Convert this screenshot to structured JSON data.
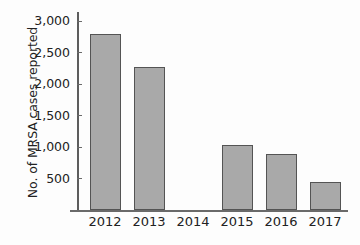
{
  "chart_data": {
    "type": "bar",
    "title": "",
    "xlabel": "",
    "ylabel": "No. of MRSA cases reported",
    "categories": [
      "2012",
      "2013",
      "2014",
      "2015",
      "2016",
      "2017"
    ],
    "values": [
      2800,
      2270,
      0,
      1030,
      890,
      440
    ],
    "ylim": [
      0,
      3150
    ],
    "yticks": [
      500,
      1000,
      1500,
      2000,
      2500,
      3000
    ],
    "ytick_labels": [
      "500",
      "1,000",
      "1,500",
      "2,000",
      "2,500",
      "3,000"
    ],
    "grid": false,
    "legend": null,
    "bar_color": "#a9a9a9",
    "bar_edge_color": "#545454",
    "axis_color": "#6a6a6a"
  }
}
